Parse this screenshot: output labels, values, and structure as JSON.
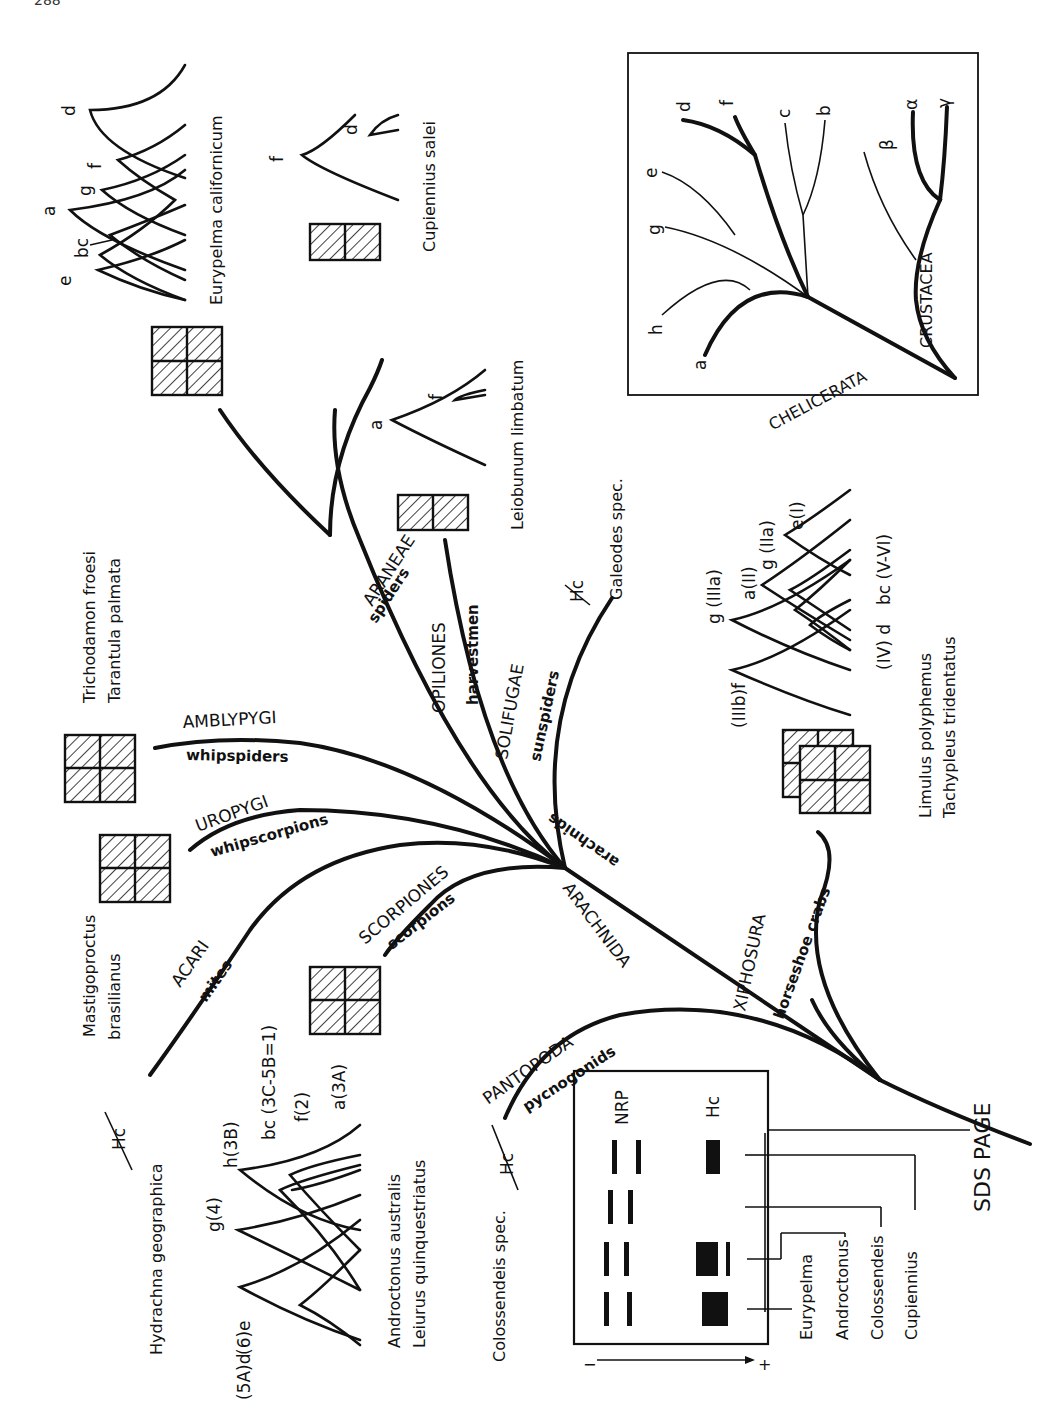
{
  "page": {
    "number": "288"
  },
  "taxa": {
    "araneae": {
      "name": "ARANEAE",
      "common": "spiders"
    },
    "opiliones": {
      "name": "OPILIONES",
      "common": "harvestmen"
    },
    "solifugae": {
      "name": "SOLIFUGAE",
      "common": "sunspiders"
    },
    "amblypygi": {
      "name": "AMBLYPYGI",
      "common": "whipspiders"
    },
    "uropygi": {
      "name": "UROPYGI",
      "common": "whipscorpions"
    },
    "acari": {
      "name": "ACARI",
      "common": "mites"
    },
    "scorpiones": {
      "name": "SCORPIONES",
      "common": "scorpions"
    },
    "arachnida": {
      "name": "ARACHNIDA",
      "common": "arachnids"
    },
    "xiphosura": {
      "name": "XIPHOSURA",
      "common": "horseshoe crabs"
    },
    "pantopoda": {
      "name": "PANTOPODA",
      "common": "pycnogonids"
    }
  },
  "species": {
    "eurypelma": "Eurypelma californicum",
    "cupiennius": "Cupiennius salei",
    "leiobunum": "Leiobunum limbatum",
    "galeodes": "Galeodes spec.",
    "trichodamon": "Trichodamon froesi",
    "tarantula": "Tarantula palmata",
    "mastigoproctus_1": "Mastigoproctus",
    "mastigoproctus_2": "brasilianus",
    "hydrachna": "Hydrachna geographica",
    "androctonus": "Androctonus australis",
    "leiurus": "Leiurus quinquestriatus",
    "colossendeis": "Colossendeis spec.",
    "limulus": "Limulus polyphemus",
    "tachypleus": "Tachypleus tridentatus"
  },
  "hc_absent": "Hc",
  "peaks": {
    "eurypelma": [
      "e",
      "bc",
      "a",
      "g",
      "f",
      "d"
    ],
    "cupiennius": [
      "f",
      "d"
    ],
    "leiobunum": [
      "a",
      "f"
    ],
    "scorpion": [
      "(6)e",
      "(5A)d",
      "g(4)",
      "h(3B)",
      "bc (3C-5B=1)",
      "f(2)",
      "a(3A)"
    ],
    "limulus": [
      "(IIIb)f",
      "g (IIIa)",
      "a(II)",
      "g (IIa)",
      "e(I)",
      "bc (V-VI)",
      "(IV) d"
    ]
  },
  "inset": {
    "clade_1": "CHELICERATA",
    "clade_2": "CRUSTACEA",
    "chelicerata_leaves": [
      "a",
      "h",
      "g",
      "e",
      "d",
      "f",
      "c",
      "b"
    ],
    "crustacea_leaves": [
      "β",
      "α",
      "γ"
    ]
  },
  "gel": {
    "col_nrp": "NRP",
    "col_hc": "Hc",
    "minus": "−",
    "plus": "+",
    "lanes": [
      "Eurypelma",
      "Androctonus",
      "Colossendeis",
      "Cupiennius"
    ],
    "title": "SDS PAGE"
  }
}
